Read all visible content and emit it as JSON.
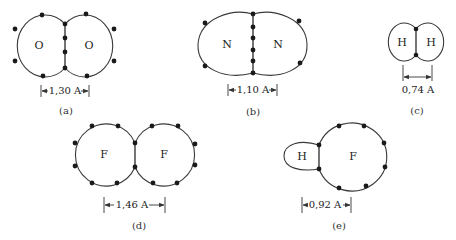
{
  "molecules": [
    {
      "id": "a",
      "caption": "(a)",
      "atoms": [
        "O",
        "O"
      ],
      "bond_length": "1,30 A",
      "shared_electrons": 4,
      "lone_electrons_per_atom": 4
    },
    {
      "id": "b",
      "caption": "(b)",
      "atoms": [
        "N",
        "N"
      ],
      "bond_length": "1,10 A",
      "shared_electrons": 6,
      "lone_electrons_per_atom": 2
    },
    {
      "id": "c",
      "caption": "(c)",
      "atoms": [
        "H",
        "H"
      ],
      "bond_length": "0,74 A",
      "shared_electrons": 2,
      "lone_electrons_per_atom": 0
    },
    {
      "id": "d",
      "caption": "(d)",
      "atoms": [
        "F",
        "F"
      ],
      "bond_length": "1,46 A",
      "shared_electrons": 2,
      "lone_electrons_per_atom": 6
    },
    {
      "id": "e",
      "caption": "(e)",
      "atoms": [
        "H",
        "F"
      ],
      "bond_length": "0,92 A",
      "shared_electrons": 2,
      "lone_electrons_per_atom": [
        0,
        6
      ]
    }
  ],
  "colors": {
    "outline": "#3a3a3a",
    "dot": "#1a1a1a",
    "text": "#222222"
  }
}
